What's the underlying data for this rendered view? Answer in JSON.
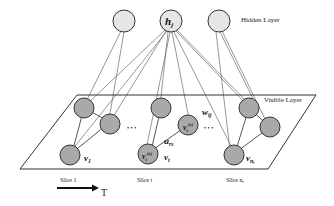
{
  "diagram": {
    "hidden_layer_label": "Hidden Layer",
    "visible_layer_label": "Visible Layer",
    "hidden_node_label": "h",
    "hidden_node_sub": "j",
    "weight_label": "w",
    "weight_sub": "ij",
    "edge_label": "u",
    "edge_sub": "rs",
    "ellipsis_1": "• • •",
    "ellipsis_2": "• • •",
    "slices": [
      {
        "label": "Slice 1",
        "var": "v",
        "var_sub": "1"
      },
      {
        "label": "Slice t",
        "var": "v",
        "var_sub": "t",
        "node_r": "v",
        "node_r_sub": "t",
        "node_r_sup": "(r)",
        "node_s": "v",
        "node_s_sub": "t",
        "node_s_sup": "(s)"
      },
      {
        "label": "Slice n",
        "label_sub": "t",
        "var": "v",
        "var_sub": "n",
        "var_subsub": "t"
      }
    ],
    "time_axis_label": "T",
    "colors": {
      "hidden_node_fill": "#e6e6e6",
      "visible_node_fill": "#a9a9a9",
      "stroke": "#333333",
      "line": "#555555"
    }
  }
}
